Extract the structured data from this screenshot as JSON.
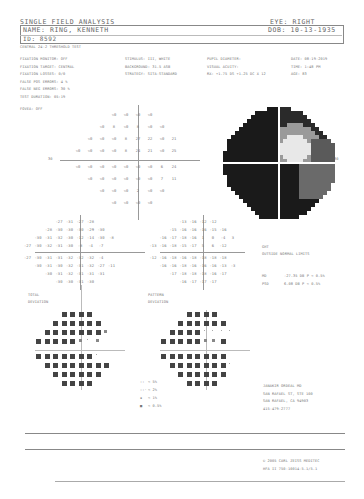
{
  "header": {
    "title": "SINGLE FIELD ANALYSIS",
    "eye": "EYE: RIGHT",
    "name": "NAME: RING, KENNETH",
    "dob": "DOB: 10-13-1935",
    "id": "ID: 8592",
    "test_name": "CENTRAL 24-2 THRESHOLD TEST"
  },
  "params_left": [
    "FIXATION MONITOR: OFF",
    "FIXATION TARGET: CENTRAL",
    "FIXATION LOSSES: 0/0",
    "FALSE POS ERRORS: 4 %",
    "FALSE NEG ERRORS: 30 %",
    "TEST DURATION: 05:19",
    "FOVEA: OFF"
  ],
  "params_mid": [
    "STIMULUS: III, WHITE",
    "BACKGROUND: 31.5 ASB",
    "STRATEGY: SITA-STANDARD"
  ],
  "params_right": [
    "PUPIL DIAMETER:",
    "VISUAL ACUITY:",
    "RX: +1.75 DS  +1.25 DC X 12"
  ],
  "params_far": [
    "DATE: 08-19-2019",
    "TIME: 1:48 PM",
    "AGE: 83"
  ],
  "threshold_map": {
    "axis_label_left": "30",
    "rows": [
      [
        "<0",
        "<0",
        "<0",
        "<0"
      ],
      [
        "<0",
        "8",
        "<0",
        "8",
        "<0",
        "<0"
      ],
      [
        "<0",
        "<0",
        "<0",
        "8",
        "27",
        "22",
        "<0",
        "21"
      ],
      [
        "<0",
        "<0",
        "<0",
        "<0",
        "8",
        "24",
        "21",
        "<0",
        "25"
      ],
      [
        "<0",
        "<0",
        "<0",
        "<0",
        "<0",
        "<0",
        "<0",
        "6",
        "24"
      ],
      [
        "<0",
        "<0",
        "<0",
        "<0",
        "<0",
        "<0",
        "7",
        "11"
      ],
      [
        "<0",
        "<0",
        "<0",
        "2",
        "<0",
        "<0"
      ],
      [
        "<0",
        "<0",
        "<0",
        "<0"
      ]
    ]
  },
  "grayscale": {
    "axis_label_right": "30"
  },
  "total_deviation": {
    "label_line1": "TOTAL",
    "label_line2": "DEVIATION",
    "rows": [
      [
        "-27",
        "-31",
        "-27",
        "-28"
      ],
      [
        "-28",
        "-30",
        "-30",
        "-30",
        "-29",
        "-30"
      ],
      [
        "-30",
        "-31",
        "-32",
        "-30",
        "-12",
        "-14",
        "-30",
        "-8"
      ],
      [
        "-27",
        "-30",
        "-32",
        "-31",
        "-30",
        "-8",
        "-4",
        "-7"
      ],
      [
        "-27",
        "-30",
        "-31",
        "-31",
        "-32",
        "-32",
        "-32",
        "-4"
      ],
      [
        "-30",
        "-31",
        "-30",
        "-32",
        "-31",
        "-32",
        "-27",
        "-11"
      ],
      [
        "-30",
        "-31",
        "-32",
        "-31",
        "-31",
        "-31"
      ],
      [
        "-30",
        "-30",
        "-31",
        "-30"
      ]
    ]
  },
  "pattern_deviation": {
    "label_line1": "PATTERN",
    "label_line2": "DEVIATION",
    "rows": [
      [
        "-13",
        "-16",
        "-12",
        "-12"
      ],
      [
        "-15",
        "-16",
        "-16",
        "-16",
        "-15",
        "-16"
      ],
      [
        "-16",
        "-17",
        "-18",
        "-16",
        "1",
        "0",
        "-4",
        "3"
      ],
      [
        "-13",
        "-16",
        "-18",
        "-15",
        "-17",
        "5",
        "6",
        "-12"
      ],
      [
        "-12",
        "-16",
        "-18",
        "-16",
        "-18",
        "-18",
        "-18",
        "-18"
      ],
      [
        "-16",
        "-16",
        "-18",
        "-16",
        "-16",
        "-16",
        "-13",
        "-3"
      ],
      [
        "-17",
        "-18",
        "-18",
        "-18",
        "-16",
        "-17"
      ],
      [
        "-16",
        "-17",
        "-17",
        "-17"
      ]
    ]
  },
  "indices": {
    "ght_label": "GHT",
    "ght_value": "OUTSIDE NORMAL LIMITS",
    "md_label": "MD",
    "md_value": "-27.35 DB  P < 0.5%",
    "psd_label": "PSD",
    "psd_value": "6.08 DB  P < 0.5%"
  },
  "legend": {
    "items": [
      {
        "symbol": "::",
        "label": "< 5%"
      },
      {
        "symbol": "::·",
        "label": "< 2%"
      },
      {
        "symbol": "▪",
        "label": "< 1%"
      },
      {
        "symbol": "■",
        "label": "< 0.5%"
      }
    ]
  },
  "clinic": {
    "lines": [
      "JANAKIR ORDEAL MD",
      "SAN RAFAEL ST, STE 100",
      "SAN RAFAEL, CA 94903",
      "415-479-2777"
    ]
  },
  "footer": {
    "line1": "© 2005 CARL ZEISS MEDITEC",
    "line2": "HFA II 750-10014-5.1/5.1"
  }
}
